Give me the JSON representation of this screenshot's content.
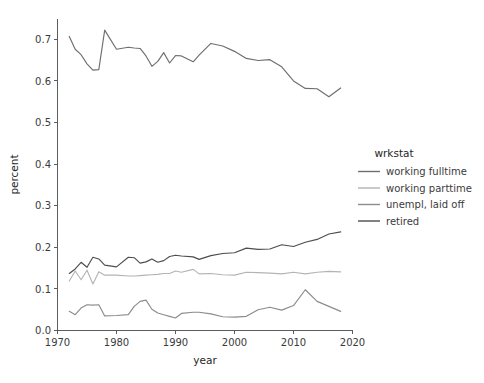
{
  "chart_data": {
    "type": "line",
    "title": "",
    "xlabel": "year",
    "ylabel": "percent",
    "xlim": [
      1970,
      2020
    ],
    "ylim": [
      0.0,
      0.75
    ],
    "xticks": [
      "1970",
      "1980",
      "1990",
      "2000",
      "2010",
      "2020"
    ],
    "xtick_values": [
      1970,
      1980,
      1990,
      2000,
      2010,
      2020
    ],
    "yticks": [
      "0.0",
      "0.1",
      "0.2",
      "0.3",
      "0.4",
      "0.5",
      "0.6",
      "0.7"
    ],
    "ytick_values": [
      0.0,
      0.1,
      0.2,
      0.3,
      0.4,
      0.5,
      0.6,
      0.7
    ],
    "grid": false,
    "legend_position": "right",
    "legend_title": "wrkstat",
    "x": [
      1972,
      1973,
      1974,
      1975,
      1976,
      1977,
      1978,
      1980,
      1982,
      1983,
      1984,
      1985,
      1986,
      1987,
      1988,
      1989,
      1990,
      1991,
      1993,
      1994,
      1996,
      1998,
      2000,
      2002,
      2004,
      2006,
      2008,
      2010,
      2012,
      2014,
      2016,
      2018
    ],
    "series": [
      {
        "name": "working fulltime",
        "color": "#6e6e6e",
        "values": [
          0.707,
          0.676,
          0.663,
          0.641,
          0.626,
          0.627,
          0.722,
          0.676,
          0.681,
          0.679,
          0.678,
          0.66,
          0.635,
          0.647,
          0.668,
          0.643,
          0.661,
          0.66,
          0.646,
          0.662,
          0.69,
          0.684,
          0.671,
          0.654,
          0.649,
          0.651,
          0.634,
          0.6,
          0.582,
          0.581,
          0.562,
          0.583
        ]
      },
      {
        "name": "working parttime",
        "color": "#b4b4b4",
        "values": [
          0.119,
          0.143,
          0.122,
          0.145,
          0.112,
          0.141,
          0.133,
          0.133,
          0.131,
          0.131,
          0.132,
          0.133,
          0.134,
          0.135,
          0.137,
          0.137,
          0.143,
          0.14,
          0.147,
          0.136,
          0.137,
          0.134,
          0.133,
          0.14,
          0.139,
          0.138,
          0.136,
          0.14,
          0.136,
          0.14,
          0.142,
          0.141
        ]
      },
      {
        "name": "unempl, laid off",
        "color": "#8c8c8c",
        "values": [
          0.046,
          0.038,
          0.054,
          0.062,
          0.061,
          0.062,
          0.035,
          0.036,
          0.038,
          0.058,
          0.07,
          0.073,
          0.051,
          0.042,
          0.038,
          0.034,
          0.03,
          0.041,
          0.044,
          0.044,
          0.04,
          0.033,
          0.032,
          0.034,
          0.05,
          0.056,
          0.049,
          0.06,
          0.098,
          0.07,
          0.058,
          0.046
        ]
      },
      {
        "name": "retired",
        "color": "#4d4d4d",
        "values": [
          0.137,
          0.148,
          0.164,
          0.152,
          0.176,
          0.172,
          0.157,
          0.153,
          0.176,
          0.175,
          0.162,
          0.165,
          0.172,
          0.164,
          0.168,
          0.178,
          0.181,
          0.179,
          0.177,
          0.171,
          0.18,
          0.185,
          0.187,
          0.198,
          0.195,
          0.196,
          0.206,
          0.202,
          0.212,
          0.219,
          0.232,
          0.237
        ]
      }
    ]
  },
  "legend": {
    "title": "wrkstat",
    "items": [
      {
        "label": "working fulltime",
        "color": "#6e6e6e"
      },
      {
        "label": "working parttime",
        "color": "#b4b4b4"
      },
      {
        "label": "unempl, laid off",
        "color": "#8c8c8c"
      },
      {
        "label": "retired",
        "color": "#4d4d4d"
      }
    ]
  },
  "axes": {
    "x_title": "year",
    "y_title": "percent"
  }
}
